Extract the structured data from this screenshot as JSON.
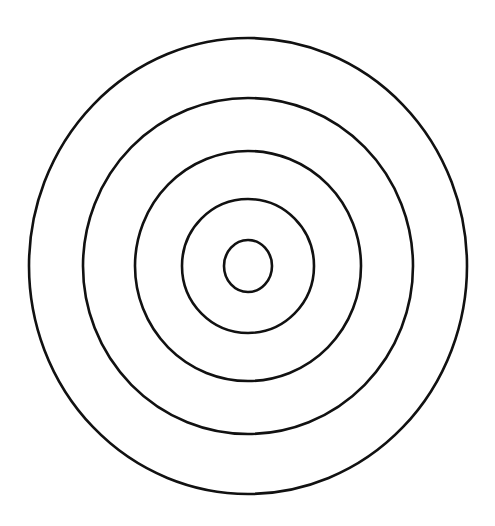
{
  "diagram": {
    "type": "concentric-circles",
    "stroke_color": "#111111",
    "background": "#ffffff",
    "center": {
      "x": 248,
      "y": 266
    },
    "rings": [
      {
        "rx": 219,
        "ry": 228
      },
      {
        "rx": 165,
        "ry": 168
      },
      {
        "rx": 113,
        "ry": 115
      },
      {
        "rx": 66,
        "ry": 67
      },
      {
        "rx": 24,
        "ry": 26
      }
    ]
  }
}
